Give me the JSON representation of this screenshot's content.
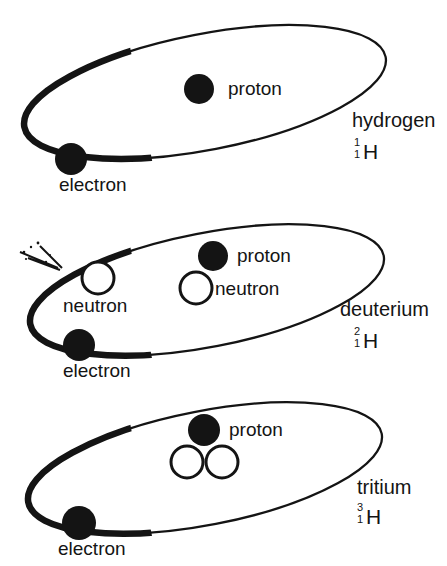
{
  "figure": {
    "background_color": "#ffffff",
    "ink_color": "#141414",
    "proton_fill": "#141414",
    "neutron_fill": "#ffffff",
    "electron_fill": "#141414",
    "orbit_stroke": "#141414"
  },
  "atoms": [
    {
      "id": "hydrogen",
      "name": "hydrogen",
      "isotope": {
        "mass_number": "1",
        "atomic_number": "1",
        "symbol": "H"
      },
      "particles": {
        "proton_label": "proton",
        "electron_label": "electron",
        "neutron_labels": []
      },
      "counts": {
        "protons": 1,
        "neutrons": 0,
        "electrons": 1
      }
    },
    {
      "id": "deuterium",
      "name": "deuterium",
      "isotope": {
        "mass_number": "2",
        "atomic_number": "1",
        "symbol": "H"
      },
      "particles": {
        "proton_label": "proton",
        "electron_label": "electron",
        "neutron_labels": [
          "neutron",
          "neutron"
        ]
      },
      "counts": {
        "protons": 1,
        "neutrons": 1,
        "electrons": 1
      }
    },
    {
      "id": "tritium",
      "name": "tritium",
      "isotope": {
        "mass_number": "3",
        "atomic_number": "1",
        "symbol": "H"
      },
      "particles": {
        "proton_label": "proton",
        "electron_label": "electron",
        "neutron_labels": []
      },
      "counts": {
        "protons": 1,
        "neutrons": 2,
        "electrons": 1
      }
    }
  ]
}
